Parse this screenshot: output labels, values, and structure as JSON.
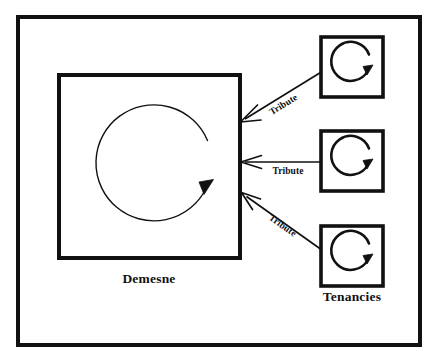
{
  "diagram": {
    "title_visible": false,
    "background_color": "#ffffff",
    "ink_color": "#111111",
    "regions": {
      "demesne": {
        "caption": "Demesne",
        "internal_cycle_icon": "circular-arrow-icon"
      },
      "tenancies": {
        "caption": "Tenancies",
        "unit_count": 3,
        "internal_cycle_icon": "circular-arrow-icon"
      }
    },
    "flows": [
      {
        "id": "flow-top",
        "label": "Tribute",
        "direction": "right-to-left",
        "orientation": "diagonal-down"
      },
      {
        "id": "flow-middle",
        "label": "Tribute",
        "direction": "right-to-left",
        "orientation": "horizontal"
      },
      {
        "id": "flow-bottom",
        "label": "Tribute",
        "direction": "right-to-left",
        "orientation": "diagonal-up"
      }
    ]
  }
}
